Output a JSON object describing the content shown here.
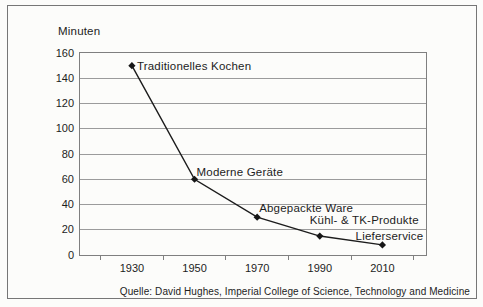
{
  "chart_data": {
    "type": "line",
    "ylabel": "Minuten",
    "categories": [
      "1930",
      "1950",
      "1970",
      "1990",
      "2010"
    ],
    "values": [
      150,
      60,
      30,
      15,
      8
    ],
    "ylim": [
      0,
      160
    ],
    "yticks": [
      0,
      20,
      40,
      60,
      80,
      100,
      120,
      140,
      160
    ],
    "grid": "horizontal",
    "legend": "none",
    "annotations": [
      {
        "text": "Traditionelles Kochen",
        "point": 0,
        "anchor": "start",
        "dx": 5,
        "dy": 0
      },
      {
        "text": "Moderne Geräte",
        "point": 1,
        "anchor": "start",
        "dx": 2,
        "dy": -7
      },
      {
        "text": "Abgepackte Ware",
        "point": 2,
        "anchor": "start",
        "dx": 2,
        "dy": -9
      },
      {
        "text": "Kühl- & TK-Produkte",
        "point": 3,
        "anchor": "end",
        "dx": 99,
        "dy": -16
      },
      {
        "text": "Lieferservice",
        "point": 4,
        "anchor": "end",
        "dx": 41,
        "dy": -9
      }
    ],
    "source": "Quelle: David Hughes, Imperial College of Science, Technology and Medicine",
    "colors": {
      "line": "#1c1c1c",
      "marker": "#161616",
      "grid": "#9b9b9b",
      "axis_border": "#7f7f7f",
      "frame_border": "#767676",
      "text": "#1d1d1d",
      "background": "#fcfcfa"
    }
  }
}
